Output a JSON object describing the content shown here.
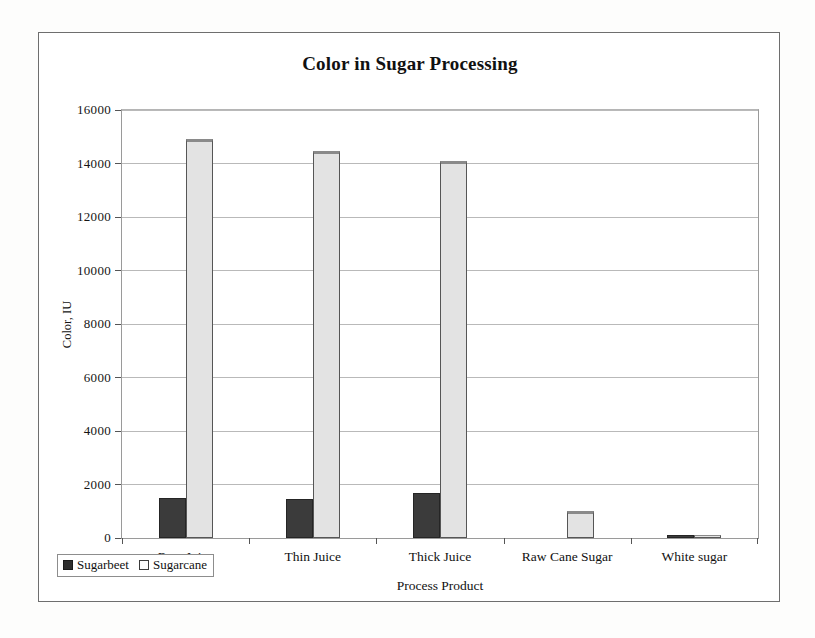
{
  "chart_data": {
    "type": "bar",
    "title": "Color in Sugar Processing",
    "xlabel": "Process Product",
    "ylabel": "Color, IU",
    "categories": [
      "Raw Juice",
      "Thin Juice",
      "Thick Juice",
      "Raw  Cane Sugar",
      "White sugar"
    ],
    "series": [
      {
        "name": "Sugarbeet",
        "color": "#3b3b3b",
        "values": [
          1500,
          1450,
          1700,
          0,
          130
        ]
      },
      {
        "name": "Sugarcane",
        "color": "#e3e3e3",
        "values": [
          14900,
          14450,
          14100,
          1000,
          110
        ]
      }
    ],
    "ylim": [
      0,
      16000
    ],
    "yticks": [
      0,
      2000,
      4000,
      6000,
      8000,
      10000,
      12000,
      14000,
      16000
    ],
    "ytick_labels": [
      "0",
      "2000",
      "4000",
      "6000",
      "8000",
      "10000",
      "12000",
      "14000",
      "16000"
    ],
    "grid": true,
    "legend_position": "bottom-left",
    "legend_entries": [
      "Sugarbeet",
      "Sugarcane"
    ]
  }
}
